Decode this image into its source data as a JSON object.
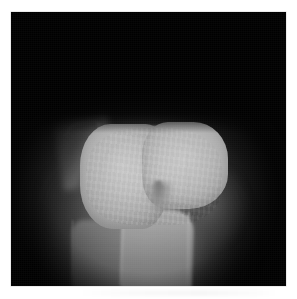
{
  "figure": {
    "modality": "radiograph",
    "view_description": "axial knee radiograph",
    "caption": "",
    "alt_text": "Grayscale radiograph showing a bright rounded bicondylar bone block with a central notch and a shaft extending inferiorly, on a black film background."
  },
  "canvas": {
    "width_px": 297,
    "height_px": 299,
    "page_background_hex": "#ffffff",
    "film_background_hex": "#000000"
  },
  "film": {
    "left_px": 11,
    "top_px": 12,
    "width_px": 275,
    "height_px": 274,
    "border_hex": "#d8d8d8"
  },
  "regions": [
    {
      "name": "soft-tissue-halo",
      "label": "Soft tissue halo",
      "grayscale_hex": "#a8a8a8"
    },
    {
      "name": "soft-tissue-column",
      "label": "Soft tissue column",
      "grayscale_hex": "#969696"
    },
    {
      "name": "lateral-spur",
      "label": "Lateral bony spur",
      "grayscale_hex": "#747474"
    },
    {
      "name": "condyle-lateral",
      "label": "Lateral condyle",
      "grayscale_hex": "#c4c4c4"
    },
    {
      "name": "condyle-medial",
      "label": "Medial condyle",
      "grayscale_hex": "#c6c6c6"
    },
    {
      "name": "intercondylar-notch",
      "label": "Intercondylar notch",
      "grayscale_hex": "#8a8a8a"
    },
    {
      "name": "bone-shaft",
      "label": "Bone shaft",
      "grayscale_hex": "#aaaaaa"
    },
    {
      "name": "adjacent-shaft",
      "label": "Adjacent shaft",
      "grayscale_hex": "#8c8c8c"
    },
    {
      "name": "medial-shoulder",
      "label": "Medial shoulder",
      "grayscale_hex": "#787878"
    }
  ]
}
